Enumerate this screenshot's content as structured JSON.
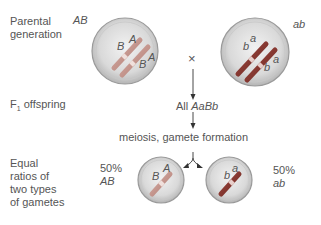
{
  "rows": {
    "parental": "Parental generation",
    "parental_l1": "Parental",
    "parental_l2": "generation",
    "f1": "F",
    "f1_sub": "1",
    "f1_rest": " offspring",
    "gametes_l1": "Equal",
    "gametes_l2": "ratios of",
    "gametes_l3": "two types",
    "gametes_l4": "of gametes"
  },
  "parents": {
    "left_genotype": "AB",
    "right_genotype": "ab",
    "cross_symbol": "×",
    "left_alleles": [
      "A",
      "B",
      "A",
      "B"
    ],
    "right_alleles": [
      "a",
      "b",
      "a",
      "b"
    ]
  },
  "offspring": {
    "prefix": "All ",
    "genotype": "AaBb"
  },
  "process": "meiosis, gamete formation",
  "gametes": {
    "left_pct": "50%",
    "left_genotype": "AB",
    "right_pct": "50%",
    "right_genotype": "ab",
    "left_alleles": [
      "A",
      "B"
    ],
    "right_alleles": [
      "a",
      "b"
    ]
  },
  "colors": {
    "dominant_chromosome": "#c99a92",
    "recessive_chromosome": "#8c3a32",
    "cell": "#d6d6d6"
  }
}
